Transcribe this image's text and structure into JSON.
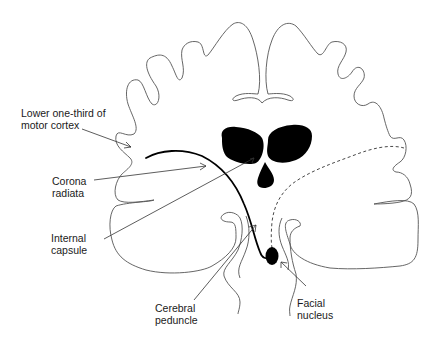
{
  "figure": {
    "background": "#ffffff",
    "ink": "#000000"
  },
  "labels": {
    "motor_cortex": "Lower one-third of\nmotor cortex",
    "corona_radiata": "Corona\nradiata",
    "internal_capsule": "Internal\ncapsule",
    "cerebral_peduncle": "Cerebral\npeduncle",
    "facial_nucleus": "Facial\nnucleus"
  },
  "structures": [
    "brain-outline-icon",
    "lateral-ventricles-icon",
    "third-ventricle-icon",
    "corticobulbar-tract-contralateral",
    "corticobulbar-tract-ipsilateral-dashed",
    "facial-nucleus-icon"
  ]
}
